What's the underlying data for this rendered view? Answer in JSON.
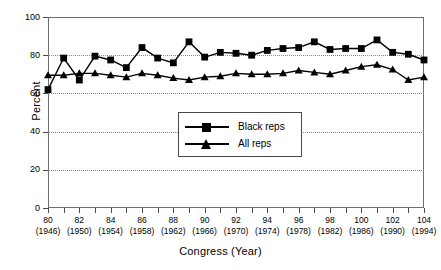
{
  "chart_data": {
    "type": "line",
    "title": "",
    "xlabel": "Congress (Year)",
    "ylabel": "Percent",
    "ylim": [
      0,
      100
    ],
    "yticks": [
      0,
      20,
      40,
      60,
      80,
      100
    ],
    "xlim": [
      80,
      104
    ],
    "grid": true,
    "legend_position": "center",
    "categories": [
      80,
      81,
      82,
      83,
      84,
      85,
      86,
      87,
      88,
      89,
      90,
      91,
      92,
      93,
      94,
      95,
      96,
      97,
      98,
      99,
      100,
      101,
      102,
      103,
      104
    ],
    "x_tick_labels": [
      {
        "congress": "80",
        "year": "(1946)"
      },
      {
        "congress": "82",
        "year": "(1950)"
      },
      {
        "congress": "84",
        "year": "(1954)"
      },
      {
        "congress": "86",
        "year": "(1958)"
      },
      {
        "congress": "88",
        "year": "(1962)"
      },
      {
        "congress": "90",
        "year": "(1966)"
      },
      {
        "congress": "92",
        "year": "(1970)"
      },
      {
        "congress": "94",
        "year": "(1974)"
      },
      {
        "congress": "96",
        "year": "(1978)"
      },
      {
        "congress": "98",
        "year": "(1982)"
      },
      {
        "congress": "100",
        "year": "(1986)"
      },
      {
        "congress": "102",
        "year": "(1990)"
      },
      {
        "congress": "104",
        "year": "(1994)"
      }
    ],
    "series": [
      {
        "name": "Black reps",
        "marker": "square",
        "values": [
          62,
          78.5,
          67,
          79.5,
          77.5,
          73.5,
          84,
          78.5,
          76,
          87,
          79,
          81.5,
          81,
          80,
          82.5,
          83.5,
          84,
          87,
          83,
          83.5,
          83.5,
          88,
          81.5,
          80.5,
          77.5
        ]
      },
      {
        "name": "All reps",
        "marker": "triangle",
        "values": [
          69.5,
          69.5,
          70.5,
          70.5,
          69.5,
          68.5,
          70.5,
          69.5,
          68,
          67,
          68.5,
          69,
          70.5,
          70,
          70,
          70.5,
          72,
          71,
          70,
          72,
          74,
          75,
          72.5,
          67,
          68.5
        ]
      }
    ]
  },
  "legend": {
    "items": [
      {
        "label": "Black reps"
      },
      {
        "label": "All reps"
      }
    ]
  }
}
